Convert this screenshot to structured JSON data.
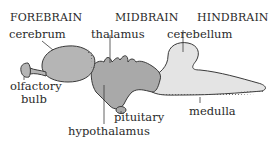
{
  "diagram": {
    "regions": [
      {
        "id": "forebrain",
        "label": "FOREBRAIN"
      },
      {
        "id": "midbrain",
        "label": "MIDBRAIN"
      },
      {
        "id": "hindbrain",
        "label": "HINDBRAIN"
      }
    ],
    "parts": [
      {
        "id": "cerebrum",
        "label": "cerebrum"
      },
      {
        "id": "thalamus",
        "label": "thalamus"
      },
      {
        "id": "cerebellum",
        "label": "cerebellum"
      },
      {
        "id": "olfactory-bulb",
        "label_line1": "olfactory",
        "label_line2": "bulb"
      },
      {
        "id": "pituitary",
        "label": "pituitary"
      },
      {
        "id": "hypothalamus",
        "label": "hypothalamus"
      },
      {
        "id": "medulla",
        "label": "medulla"
      }
    ],
    "colors": {
      "forebrain_fill": "#b5b5b5",
      "midbrain_fill": "#a9a9a9",
      "hindbrain_fill": "#e4e4e4",
      "outline": "#3a3a3a",
      "text": "#2a2a2a"
    }
  }
}
